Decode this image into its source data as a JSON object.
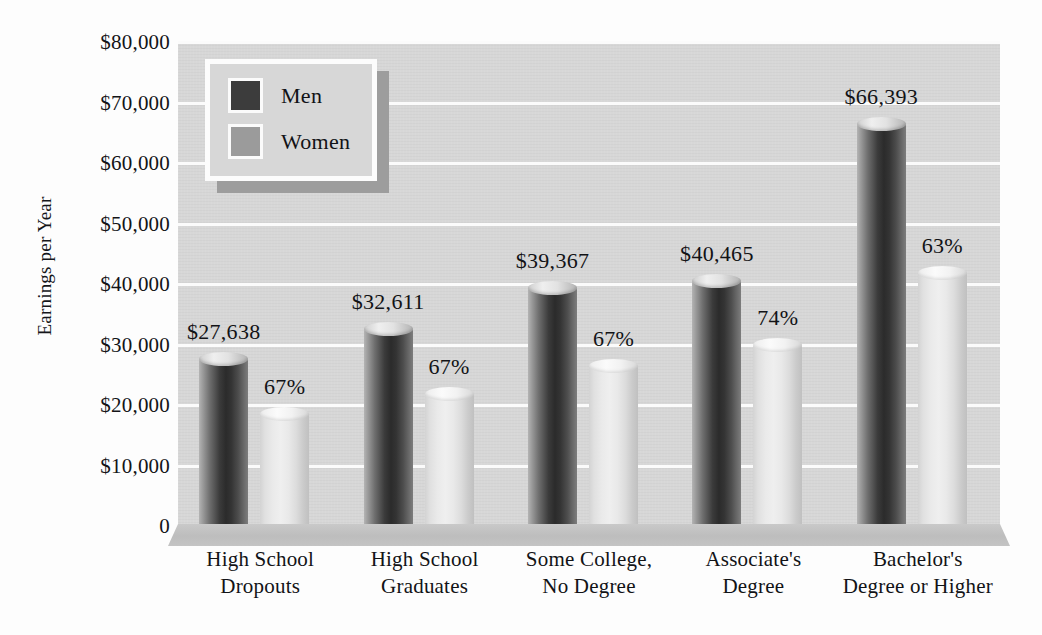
{
  "chart_data": {
    "type": "bar",
    "title": "",
    "xlabel": "",
    "ylabel": "Earnings per Year",
    "ylim": [
      0,
      80000
    ],
    "ytick_step": 10000,
    "grid": true,
    "legend_position": "top-left-inside",
    "categories": [
      "High School\nDropouts",
      "High School\nGraduates",
      "Some College,\nNo Degree",
      "Associate's\nDegree",
      "Bachelor's\nDegree or Higher"
    ],
    "category_lines": [
      [
        "High School",
        "Dropouts"
      ],
      [
        "High School",
        "Graduates"
      ],
      [
        "Some College,",
        "No Degree"
      ],
      [
        "Associate's",
        "Degree"
      ],
      [
        "Bachelor's",
        "Degree or Higher"
      ]
    ],
    "series": [
      {
        "name": "Men",
        "color": "#3c3c3c",
        "values": [
          27638,
          32611,
          39367,
          40465,
          66393
        ],
        "labels": [
          "$27,638",
          "$32,611",
          "$39,367",
          "$40,465",
          "$66,393"
        ]
      },
      {
        "name": "Women",
        "color": "#9b9b9b",
        "values": [
          18517,
          21849,
          26376,
          29944,
          41828
        ],
        "labels": [
          "67%",
          "67%",
          "67%",
          "74%",
          "63%"
        ],
        "label_meaning": "women's earnings as a percent of men's earnings"
      }
    ],
    "ytick_labels": [
      "$80,000",
      "$70,000",
      "$60,000",
      "$50,000",
      "$40,000",
      "$30,000",
      "$20,000",
      "$10,000",
      "0"
    ],
    "ytick_values": [
      80000,
      70000,
      60000,
      50000,
      40000,
      30000,
      20000,
      10000,
      0
    ]
  },
  "legend": {
    "items": [
      {
        "label": "Men",
        "swatch": "men-swatch",
        "color": "#3c3c3c"
      },
      {
        "label": "Women",
        "swatch": "women-swatch",
        "color": "#9b9b9b"
      }
    ]
  },
  "colors": {
    "plot_background": "#d7d7d7",
    "gridline": "#fbfbfb",
    "men_bar": "#3c3c3c",
    "women_bar": "#e3e3e3",
    "text": "#121316",
    "page_background": "#fdfdfd"
  }
}
